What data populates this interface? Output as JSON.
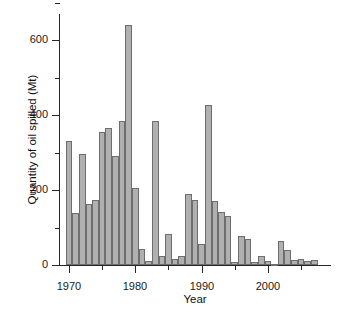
{
  "chart_data": {
    "type": "bar",
    "title": "",
    "xlabel": "Year",
    "ylabel": "Quantity of oil spilled (Mt)",
    "xlim": [
      1968.5,
      2008.0
    ],
    "ylim": [
      0,
      700
    ],
    "grid": false,
    "legend": null,
    "bar_color": "#b0b0b0",
    "bar_edge_color": "#6e6e6e",
    "axis_color": "#262626",
    "x_major_ticks": [
      1970,
      1980,
      1990,
      2000
    ],
    "x_major_tick_labels": [
      "1970",
      "1980",
      "1990",
      "2000"
    ],
    "x_minor_ticks": [
      1975,
      1985,
      1995,
      2005
    ],
    "y_major_ticks": [
      0,
      200,
      400,
      600
    ],
    "y_major_tick_labels": [
      "0",
      "200",
      "400",
      "600"
    ],
    "y_minor_ticks": [
      100,
      300,
      500,
      700
    ],
    "categories": [
      "1970",
      "1971",
      "1972",
      "1973",
      "1974",
      "1975",
      "1976",
      "1977",
      "1978",
      "1979",
      "1980",
      "1981",
      "1982",
      "1983",
      "1984",
      "1985",
      "1986",
      "1987",
      "1988",
      "1989",
      "1990",
      "1991",
      "1992",
      "1993",
      "1994",
      "1995",
      "1996",
      "1997",
      "1998",
      "1999",
      "2000",
      "2001",
      "2002",
      "2003",
      "2004",
      "2005",
      "2006",
      "2007"
    ],
    "values": [
      332,
      140,
      296,
      163,
      174,
      355,
      365,
      290,
      385,
      640,
      205,
      44,
      10,
      383,
      23,
      84,
      16,
      24,
      189,
      174,
      57,
      428,
      172,
      142,
      132,
      8,
      78,
      70,
      9,
      24,
      11,
      4,
      63,
      39,
      13,
      16,
      11,
      14
    ]
  },
  "axes": {
    "y_title": "Quantity of oil spilled (Mt)",
    "x_title": "Year"
  }
}
